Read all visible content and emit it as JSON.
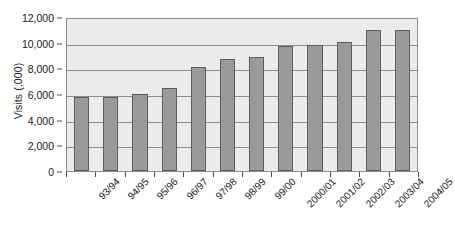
{
  "chart_data": {
    "type": "bar",
    "title": "",
    "xlabel": "",
    "ylabel": "Visits (,000)",
    "categories": [
      "93/94",
      "94/95",
      "95/96",
      "96/97",
      "97/98",
      "98/99",
      "99/00",
      "2000/01",
      "2001/02",
      "2002/03",
      "2003/04",
      "2004/05"
    ],
    "values": [
      5800,
      5800,
      6000,
      6450,
      8100,
      8700,
      8900,
      9750,
      9820,
      10080,
      10950,
      10950
    ],
    "ylim": [
      0,
      12000
    ],
    "ytick_labels": [
      "0",
      "2,000",
      "4,000",
      "6,000",
      "8,000",
      "10,000",
      "12,000"
    ],
    "ytick_values": [
      0,
      2000,
      4000,
      6000,
      8000,
      10000,
      12000
    ],
    "grid": true,
    "legend": "none",
    "bar_color": "#9a9a9a",
    "bar_border_color": "#5d5d5d",
    "plot_background": "#ebebeb",
    "axis_color": "#8d8d8d"
  }
}
